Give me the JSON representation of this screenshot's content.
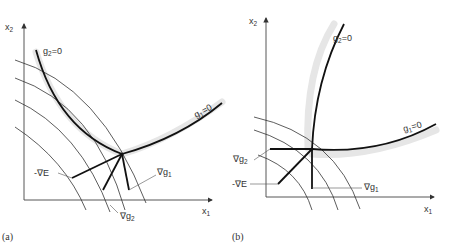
{
  "panels": [
    {
      "id": "a",
      "caption": "(a)",
      "axes": {
        "x_label": "x",
        "x_sub": "1",
        "y_label": "x",
        "y_sub": "2"
      },
      "curves": [
        {
          "name": "g2",
          "label": "g",
          "sub": "2",
          "eq": "=0"
        },
        {
          "name": "g1",
          "label": "g",
          "sub": "1",
          "eq": "=0"
        }
      ],
      "vectors": [
        {
          "name": "neg-grad-E",
          "label": "-∇E"
        },
        {
          "name": "grad-g1",
          "label": "∇g",
          "sub": "1"
        },
        {
          "name": "grad-g2",
          "label": "∇g",
          "sub": "2"
        }
      ]
    },
    {
      "id": "b",
      "caption": "(b)",
      "axes": {
        "x_label": "x",
        "x_sub": "1",
        "y_label": "x",
        "y_sub": "2"
      },
      "curves": [
        {
          "name": "g2",
          "label": "g",
          "sub": "2",
          "eq": "=0"
        },
        {
          "name": "g1",
          "label": "g",
          "sub": "1",
          "eq": "=0"
        }
      ],
      "vectors": [
        {
          "name": "grad-g2",
          "label": "∇g",
          "sub": "2"
        },
        {
          "name": "neg-grad-E",
          "label": "-∇E"
        },
        {
          "name": "grad-g1",
          "label": "∇g",
          "sub": "1"
        }
      ]
    }
  ]
}
